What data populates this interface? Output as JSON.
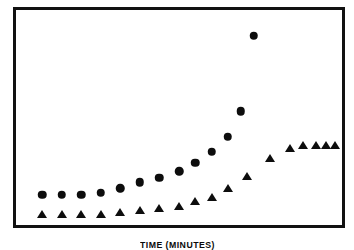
{
  "chart_data": {
    "type": "scatter",
    "title": "",
    "xlabel": "TIME (MINUTES)",
    "ylabel": "SAMPLE TEMP. (°C)",
    "grid": false,
    "legend": "none",
    "axis_ticks": "none",
    "xlim": [
      0,
      100
    ],
    "ylim": [
      0,
      100
    ],
    "series": [
      {
        "name": "circle-series",
        "marker": "circle",
        "color": "#0d0d0d",
        "x": [
          8,
          14,
          20,
          26,
          32,
          38,
          44,
          50,
          55,
          60,
          65,
          69,
          73
        ],
        "y": [
          14,
          14,
          14,
          15,
          17,
          20,
          22,
          25,
          29,
          34,
          41,
          53,
          88
        ]
      },
      {
        "name": "triangle-series",
        "marker": "triangle",
        "color": "#0d0d0d",
        "x": [
          8,
          14,
          20,
          26,
          32,
          38,
          44,
          50,
          55,
          60,
          65,
          71,
          78,
          84,
          88,
          92,
          95,
          98
        ],
        "y": [
          5,
          5,
          5,
          5,
          6,
          7,
          8,
          9,
          11,
          13,
          17,
          23,
          31,
          36,
          37,
          37,
          37,
          37
        ]
      }
    ]
  }
}
